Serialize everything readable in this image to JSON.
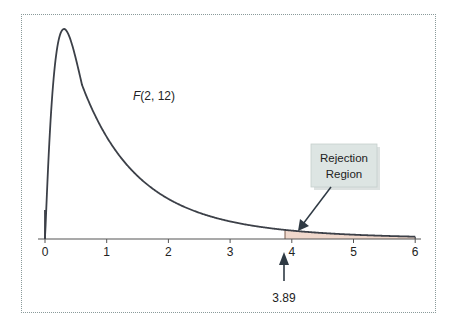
{
  "chart_data": {
    "type": "area",
    "title": "",
    "distribution_label": "F(2, 12)",
    "distribution_label_italic_part": "F",
    "distribution_label_rest": "(2, 12)",
    "xlabel": "",
    "ylabel": "",
    "x_ticks": [
      0,
      1,
      2,
      3,
      4,
      5,
      6
    ],
    "x_tick_labels": [
      "0",
      "1",
      "2",
      "3",
      "4",
      "5",
      "6"
    ],
    "xlim": [
      0,
      6
    ],
    "grid": false,
    "df1": 2,
    "df2": 12,
    "critical_value": 3.89,
    "critical_value_label": "3.89",
    "shaded_region": {
      "from": 3.89,
      "to": 6,
      "label": "Rejection Region"
    },
    "callout": {
      "line1": "Rejection",
      "line2": "Region"
    },
    "curve_samples": {
      "x": [
        0,
        0.1,
        0.2,
        0.3,
        0.5,
        0.75,
        1,
        1.5,
        2,
        2.5,
        3,
        3.5,
        3.89,
        4,
        5,
        6
      ],
      "relative_density": [
        0.0,
        0.78,
        0.97,
        1.0,
        0.91,
        0.74,
        0.58,
        0.35,
        0.21,
        0.13,
        0.085,
        0.056,
        0.042,
        0.039,
        0.02,
        0.011
      ]
    },
    "colors": {
      "curve": "#3c4048",
      "shade": "#f0d8cc",
      "callout_bg": "#dde5e3",
      "border": "#8a9a9a",
      "arrow": "#2f3a44"
    }
  }
}
